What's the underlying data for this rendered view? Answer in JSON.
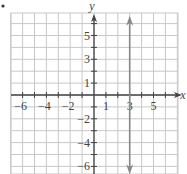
{
  "chart_data": {
    "type": "line",
    "title": "",
    "xlabel": "x",
    "ylabel": "y",
    "xlim": [
      -7,
      7
    ],
    "ylim": [
      -6.7,
      6.8
    ],
    "grid": true,
    "x_tick_labels": [
      "-6",
      "-4",
      "-2",
      "1",
      "3",
      "5"
    ],
    "x_tick_values": [
      -6,
      -4,
      -2,
      1,
      3,
      5
    ],
    "y_tick_labels": [
      "5",
      "3",
      "1",
      "-2",
      "-4",
      "-6"
    ],
    "y_tick_values": [
      5,
      3,
      1,
      -2,
      -4,
      -6
    ],
    "series": [
      {
        "name": "x = 3",
        "kind": "vertical-line",
        "x": [
          3,
          3
        ],
        "y": [
          -6.5,
          6.5
        ],
        "arrows": "both",
        "color": "#888888"
      }
    ],
    "colors": {
      "grid": "#c8c8c8",
      "axes": "#444444",
      "line": "#888888"
    },
    "marker": "•"
  }
}
